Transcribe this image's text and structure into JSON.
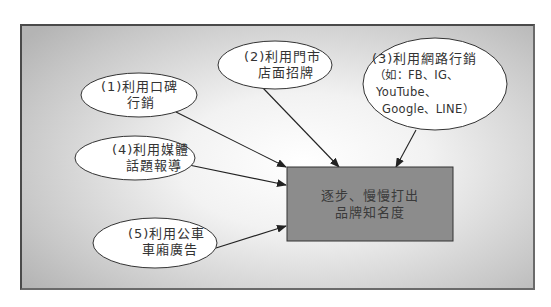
{
  "diagram": {
    "type": "flow",
    "colors": {
      "frame_border": "#4a4a4a",
      "background_center": "#ffffff",
      "background_edge": "#b4b4b4",
      "ellipse_fill": "#ffffff",
      "ellipse_stroke": "#333333",
      "target_fill": "#8c8c8c",
      "target_stroke": "#333333",
      "arrow": "#222222",
      "text": "#333333"
    },
    "target": {
      "id": "target",
      "lines": [
        "逐步、慢慢打出",
        "品牌知名度"
      ]
    },
    "nodes": [
      {
        "id": "node-1",
        "lines": [
          "(1)利用口碑",
          "行銷"
        ]
      },
      {
        "id": "node-2",
        "lines": [
          "(2)利用門市",
          "店面招牌"
        ]
      },
      {
        "id": "node-3",
        "lines": [
          "(3)利用網路行銷",
          "（如：FB、IG、",
          "YouTube、",
          "Google、LINE）"
        ]
      },
      {
        "id": "node-4",
        "lines": [
          "(4)利用媒體",
          "話題報導"
        ]
      },
      {
        "id": "node-5",
        "lines": [
          "(5)利用公車",
          "車廂廣告"
        ]
      }
    ],
    "edges": [
      {
        "from": "node-1",
        "to": "target"
      },
      {
        "from": "node-2",
        "to": "target"
      },
      {
        "from": "node-3",
        "to": "target"
      },
      {
        "from": "node-4",
        "to": "target"
      },
      {
        "from": "node-5",
        "to": "target"
      }
    ]
  }
}
